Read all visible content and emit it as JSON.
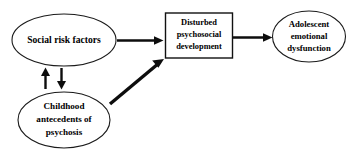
{
  "diagram": {
    "background_color": "#ffffff",
    "stroke_color": "#0d0d0d",
    "nodes": {
      "social_risk": {
        "shape": "ellipse",
        "label": "Social risk factors",
        "lines": [
          "Social risk factors"
        ]
      },
      "disturbed_development": {
        "shape": "rectangle",
        "label": "Disturbed psychosocial development",
        "lines": [
          "Disturbed",
          "psychosocial",
          "development"
        ]
      },
      "adolescent_dysfunction": {
        "shape": "ellipse",
        "label": "Adolescent emotional dysfunction",
        "lines": [
          "Adolescent",
          "emotional",
          "dysfunction"
        ]
      },
      "childhood_antecedents": {
        "shape": "ellipse",
        "label": "Childhood antecedents of psychosis",
        "lines": [
          "Childhood",
          "antecedents of",
          "psychosis"
        ]
      }
    },
    "edges": [
      {
        "id": "social-risk-to-development",
        "from": "social_risk",
        "to": "disturbed_development",
        "style": "solid",
        "direction": "forward",
        "orientation": "horizontal"
      },
      {
        "id": "development-to-dysfunction",
        "from": "disturbed_development",
        "to": "adolescent_dysfunction",
        "style": "solid",
        "direction": "forward",
        "orientation": "horizontal"
      },
      {
        "id": "childhood-to-development",
        "from": "childhood_antecedents",
        "to": "disturbed_development",
        "style": "solid",
        "direction": "forward",
        "orientation": "diagonal"
      },
      {
        "id": "childhood-up-to-social-risk",
        "from": "childhood_antecedents",
        "to": "social_risk",
        "style": "solid",
        "direction": "forward",
        "orientation": "vertical-up"
      },
      {
        "id": "social-risk-down-to-childhood",
        "from": "social_risk",
        "to": "childhood_antecedents",
        "style": "solid",
        "direction": "forward",
        "orientation": "vertical-down"
      }
    ]
  }
}
